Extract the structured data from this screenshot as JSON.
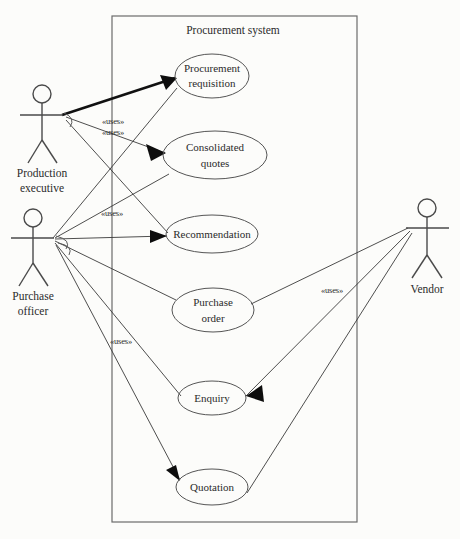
{
  "diagram": {
    "kind": "uml-use-case-diagram",
    "background_color": "#fcfcfa",
    "line_color": "#3a3a3a",
    "boundary": {
      "label": "Procurement system",
      "x": 112,
      "y": 16,
      "width": 245,
      "height": 506,
      "label_x": 233,
      "label_y": 30
    },
    "actors": [
      {
        "id": "production-executive",
        "label_line1": "Production",
        "label_line2": "executive",
        "head_cx": 42,
        "head_cy": 94,
        "label_x": 42,
        "label_y": 174
      },
      {
        "id": "purchase-officer",
        "label_line1": "Purchase",
        "label_line2": "officer",
        "head_cx": 33,
        "head_cy": 218,
        "label_x": 33,
        "label_y": 297
      },
      {
        "id": "vendor",
        "label_line1": "Vendor",
        "label_line2": "",
        "head_cx": 427,
        "head_cy": 208,
        "label_x": 427,
        "label_y": 290
      }
    ],
    "use_cases": [
      {
        "id": "procurement-requisition",
        "line1": "Procurement",
        "line2": "requisition",
        "cx": 212,
        "cy": 76,
        "rx": 37,
        "ry": 22
      },
      {
        "id": "consolidated-quotes",
        "line1": "Consolidated",
        "line2": "quotes",
        "cx": 215,
        "cy": 155,
        "rx": 52,
        "ry": 24
      },
      {
        "id": "recommendation",
        "line1": "Recommendation",
        "line2": "",
        "cx": 212,
        "cy": 234,
        "rx": 46,
        "ry": 19
      },
      {
        "id": "purchase-order",
        "line1": "Purchase",
        "line2": "order",
        "cx": 213,
        "cy": 310,
        "rx": 41,
        "ry": 22
      },
      {
        "id": "enquiry",
        "line1": "Enquiry",
        "line2": "",
        "cx": 212,
        "cy": 398,
        "rx": 34,
        "ry": 17
      },
      {
        "id": "quotation",
        "line1": "Quotation",
        "line2": "",
        "cx": 212,
        "cy": 487,
        "rx": 36,
        "ry": 18
      }
    ],
    "uses_labels": [
      {
        "id": "uses-1",
        "text": "«uses»",
        "x": 113,
        "y": 122
      },
      {
        "id": "uses-2",
        "text": "«uses»",
        "x": 113,
        "y": 133
      },
      {
        "id": "uses-3",
        "text": "«uses»",
        "x": 112,
        "y": 214
      },
      {
        "id": "uses-4",
        "text": "«uses»",
        "x": 121,
        "y": 342
      },
      {
        "id": "uses-5",
        "text": "«uses»",
        "x": 332,
        "y": 291
      }
    ],
    "relationships": [
      {
        "from": "production-executive",
        "to": "procurement-requisition",
        "style": "bold-arrow"
      },
      {
        "from": "production-executive",
        "to": "consolidated-quotes",
        "style": "arrow"
      },
      {
        "from": "production-executive",
        "to": "recommendation",
        "style": "arrow"
      },
      {
        "from": "purchase-officer",
        "to": "procurement-requisition",
        "style": "plain"
      },
      {
        "from": "purchase-officer",
        "to": "consolidated-quotes",
        "style": "plain"
      },
      {
        "from": "purchase-officer",
        "to": "recommendation",
        "style": "arrow"
      },
      {
        "from": "purchase-officer",
        "to": "purchase-order",
        "style": "plain"
      },
      {
        "from": "purchase-officer",
        "to": "enquiry",
        "style": "plain"
      },
      {
        "from": "purchase-officer",
        "to": "quotation",
        "style": "arrow"
      },
      {
        "from": "vendor",
        "to": "purchase-order",
        "style": "plain"
      },
      {
        "from": "vendor",
        "to": "enquiry",
        "style": "arrow"
      },
      {
        "from": "vendor",
        "to": "quotation",
        "style": "plain"
      }
    ]
  }
}
